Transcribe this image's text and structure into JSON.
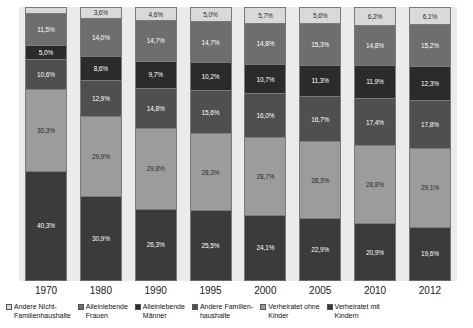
{
  "chart_data": {
    "type": "bar",
    "subtype": "stacked-percentage",
    "title": "",
    "xlabel": "",
    "ylabel": "",
    "ylim": [
      0,
      100
    ],
    "grid": false,
    "legend_position": "bottom",
    "categories": [
      "1970",
      "1980",
      "1990",
      "1995",
      "2000",
      "2005",
      "2010",
      "2012"
    ],
    "series": [
      {
        "name": "Andere Nicht-Familienhaushalte",
        "color": "#d9d9d9",
        "label_color": "dark",
        "values": [
          1.9,
          3.6,
          4.6,
          5.0,
          5.7,
          5.6,
          6.2,
          6.1
        ],
        "labels": [
          "",
          "3,6%",
          "4,6%",
          "5,0%",
          "5,7%",
          "5,6%",
          "6,2%",
          "6,1%"
        ]
      },
      {
        "name": "Alleinlebende Frauen",
        "color": "#6e6e6e",
        "label_color": "light",
        "values": [
          11.5,
          14.0,
          14.7,
          14.7,
          14.8,
          15.3,
          14.8,
          15.2
        ],
        "labels": [
          "11,5%",
          "14,0%",
          "14,7%",
          "14,7%",
          "14,8%",
          "15,3%",
          "14,8%",
          "15,2%"
        ]
      },
      {
        "name": "Alleinlebende Männer",
        "color": "#2b2b2b",
        "label_color": "light",
        "values": [
          5.0,
          8.6,
          9.7,
          10.2,
          10.7,
          11.3,
          11.9,
          12.3
        ],
        "labels": [
          "5,0%",
          "8,6%",
          "9,7%",
          "10,2%",
          "10,7%",
          "11,3%",
          "11,9%",
          "12,3%"
        ]
      },
      {
        "name": "Andere Familienhaushalte",
        "color": "#4f4f4f",
        "label_color": "light",
        "values": [
          10.6,
          12.9,
          14.8,
          15.6,
          16.0,
          16.7,
          17.4,
          17.8
        ],
        "labels": [
          "10,6%",
          "12,9%",
          "14,8%",
          "15,6%",
          "16,0%",
          "16,7%",
          "17,4%",
          "17,8%"
        ]
      },
      {
        "name": "Verheiratet ohne Kinder",
        "color": "#9c9c9c",
        "label_color": "dark",
        "values": [
          30.3,
          29.9,
          29.8,
          28.3,
          28.7,
          28.3,
          28.8,
          29.1
        ],
        "labels": [
          "30,3%",
          "29,9%",
          "29,8%",
          "28,3%",
          "28,7%",
          "28,3%",
          "28,8%",
          "29,1%"
        ]
      },
      {
        "name": "Verheiratet mit Kindern",
        "color": "#3b3b3b",
        "label_color": "light",
        "values": [
          40.3,
          30.9,
          26.3,
          25.5,
          24.1,
          22.9,
          20.9,
          19.6
        ],
        "labels": [
          "40,3%",
          "30,9%",
          "26,3%",
          "25,5%",
          "24,1%",
          "22,9%",
          "20,9%",
          "19,6%"
        ]
      }
    ]
  },
  "legend": {
    "items": [
      {
        "label": "Andere Nicht-\nFamilienhaushalte",
        "color": "#d9d9d9"
      },
      {
        "label": "Alleinlebende\nFrauen",
        "color": "#6e6e6e"
      },
      {
        "label": "Alleinlebende\nMänner",
        "color": "#2b2b2b"
      },
      {
        "label": "Andere Familien-\nhaushalte",
        "color": "#4f4f4f"
      },
      {
        "label": "Verheiratet ohne\nKinder",
        "color": "#9c9c9c"
      },
      {
        "label": "Verheiratet mit\nKindern",
        "color": "#3b3b3b"
      }
    ]
  },
  "colors": {
    "plot_background": "#ebebeb",
    "page_background": "#ffffff",
    "axis_text": "#1a1a1a"
  }
}
